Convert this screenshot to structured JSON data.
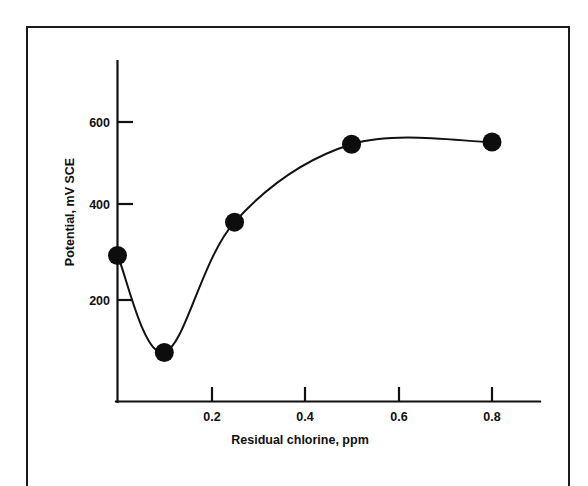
{
  "figure": {
    "background_color": "#ffffff",
    "ink_color": "#111111",
    "frame": {
      "present": true,
      "color": "#1a1a1a"
    }
  },
  "chart_data": {
    "type": "line",
    "title": "",
    "subtitle": "",
    "xlabel": "Residual chlorine, ppm",
    "ylabel": "Potential, mV SCE",
    "xlim": [
      0,
      0.99
    ],
    "ylim": [
      0,
      720
    ],
    "xticks": [
      0.2,
      0.4,
      0.6,
      0.8
    ],
    "xticklabels": [
      "0.2",
      "0.4",
      "0.6",
      "0.8"
    ],
    "yticks": [
      200,
      400,
      600
    ],
    "yticklabels": [
      "200",
      "400",
      "600"
    ],
    "grid": false,
    "legend": null,
    "tick_direction": "in",
    "marker": "filled-circle",
    "series": [
      {
        "name": "Potential vs residual chlorine",
        "x": [
          0.0,
          0.1,
          0.25,
          0.5,
          0.8
        ],
        "y": [
          300,
          82,
          375,
          550,
          555
        ]
      }
    ],
    "annotations": []
  },
  "axes": {
    "y_axis_name": "potential-axis",
    "x_axis_name": "residual-chlorine-axis"
  }
}
